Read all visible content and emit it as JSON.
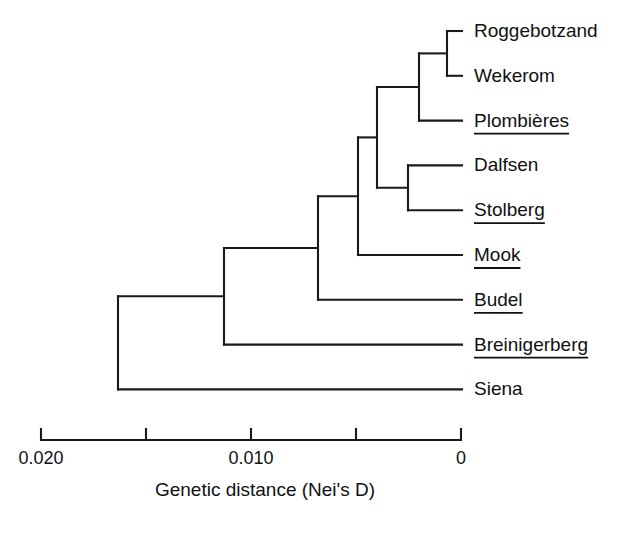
{
  "figure": {
    "title": "",
    "background_color": "#ffffff",
    "line_color": "#1a1a1a",
    "text_color": "#111111"
  },
  "chart_data": {
    "type": "line",
    "chart_subtype": "dendrogram",
    "title": "",
    "xlabel": "Genetic distance (Nei's D)",
    "ylabel": "",
    "xlim": [
      0.02,
      0.0
    ],
    "x_axis_reversed": true,
    "grid": false,
    "legend": null,
    "tick_labels": [
      "0.020",
      "0.010",
      "0"
    ],
    "ticks": [
      0.02,
      0.015,
      0.01,
      0.005,
      0.0
    ],
    "tick_labelled": [
      true,
      false,
      true,
      false,
      true
    ],
    "categories": [
      "Roggebotzand",
      "Wekerom",
      "Plombières",
      "Dalfsen",
      "Stolberg",
      "Mook",
      "Budel",
      "Breinigerberg",
      "Siena"
    ],
    "leaves": [
      {
        "name": "Roggebotzand",
        "underlined": false,
        "row": 0
      },
      {
        "name": "Wekerom",
        "underlined": false,
        "row": 1
      },
      {
        "name": "Plombières",
        "underlined": true,
        "row": 2
      },
      {
        "name": "Dalfsen",
        "underlined": false,
        "row": 3
      },
      {
        "name": "Stolberg",
        "underlined": true,
        "row": 4
      },
      {
        "name": "Mook",
        "underlined": true,
        "row": 5
      },
      {
        "name": "Budel",
        "underlined": true,
        "row": 6
      },
      {
        "name": "Breinigerberg",
        "underlined": true,
        "row": 7
      },
      {
        "name": "Siena",
        "underlined": false,
        "row": 8
      }
    ],
    "merges": [
      {
        "id": "n1",
        "label": "Roggebotzand + Wekerom",
        "distance": 0.0008,
        "children": [
          "Roggebotzand",
          "Wekerom"
        ]
      },
      {
        "id": "n2",
        "label": "(Roggebotzand, Wekerom) + Plombières",
        "distance": 0.002,
        "children": [
          "n1",
          "Plombières"
        ]
      },
      {
        "id": "n3",
        "label": "Dalfsen + Stolberg",
        "distance": 0.0025,
        "children": [
          "Dalfsen",
          "Stolberg"
        ]
      },
      {
        "id": "n4",
        "label": "(Roggebotzand, Wekerom, Plombières) + (Dalfsen, Stolberg)",
        "distance": 0.004,
        "children": [
          "n2",
          "n3"
        ]
      },
      {
        "id": "n5",
        "label": "upper clade + Mook",
        "distance": 0.0049,
        "children": [
          "n4",
          "Mook"
        ]
      },
      {
        "id": "n6",
        "label": "upper clade + Budel",
        "distance": 0.0078,
        "children": [
          "n5",
          "Budel"
        ]
      },
      {
        "id": "n7",
        "label": "upper clade + Breinigerberg",
        "distance": 0.0112,
        "children": [
          "n6",
          "Breinigerberg"
        ]
      },
      {
        "id": "n8",
        "label": "root: all + Siena",
        "distance": 0.0163,
        "children": [
          "n7",
          "Siena"
        ]
      }
    ],
    "annotations": []
  },
  "geometry": {
    "plot_left_px": 41,
    "plot_right_px": 462,
    "row_top_px": 31,
    "row_step_px": 44.8,
    "axis_y_px": 440,
    "tick_height_px": 11,
    "tick_x_px": [
      41,
      146,
      251,
      356,
      461
    ],
    "tick_label_y_px": 464,
    "axis_title_y_px": 496,
    "axis_title_x_px": 265,
    "label_offset_px": 12,
    "node_x_px": {
      "n1": 447,
      "n2": 419,
      "n3": 408,
      "n4": 377,
      "n5": 358,
      "n6": 318,
      "n7": 224,
      "n8": 118
    }
  },
  "axis": {
    "label": "Genetic distance (Nei's D)",
    "tick_0": "0.020",
    "tick_1": "0.010",
    "tick_2": "0"
  }
}
